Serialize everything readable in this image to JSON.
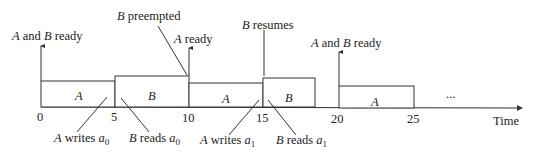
{
  "diagram": {
    "type": "task-schedule-timeline",
    "axis": {
      "label": "Time",
      "ticks": [
        "0",
        "5",
        "10",
        "15",
        "20",
        "25"
      ],
      "ellipsis": "..."
    },
    "blocks": [
      {
        "task": "A",
        "start": 0,
        "end": 5
      },
      {
        "task": "B",
        "start": 5,
        "end": 10
      },
      {
        "task": "A",
        "start": 10,
        "end": 15
      },
      {
        "task": "B",
        "start": 15,
        "end": 18.5
      },
      {
        "task": "A",
        "start": 20,
        "end": 25
      }
    ],
    "events_above": [
      {
        "pre": "A",
        "mid": " and ",
        "post": "B",
        "tail": " ready",
        "time": 0
      },
      {
        "pre": "B",
        "tail": " preempted",
        "time": 10
      },
      {
        "pre": "A",
        "tail": " ready",
        "time": 10
      },
      {
        "pre": "B",
        "tail": " resumes",
        "time": 15
      },
      {
        "pre": "A",
        "mid": " and ",
        "post": "B",
        "tail": " ready",
        "time": 20
      }
    ],
    "events_below": [
      {
        "task": "A",
        "verb": " writes ",
        "var": "a",
        "sub": "0"
      },
      {
        "task": "B",
        "verb": " reads ",
        "var": "a",
        "sub": "0"
      },
      {
        "task": "A",
        "verb": " writes ",
        "var": "a",
        "sub": "1"
      },
      {
        "task": "B",
        "verb": " reads ",
        "var": "a",
        "sub": "1"
      }
    ]
  }
}
